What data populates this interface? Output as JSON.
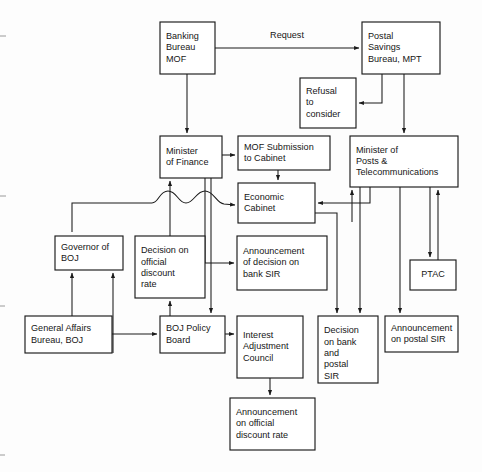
{
  "diagram": {
    "edge_label_request": "Request",
    "colors": {
      "background": "#fdfdfd",
      "box_fill": "#ffffff",
      "line": "#1a1a1a",
      "text": "#161616"
    },
    "nodes": [
      {
        "id": "banking-bureau-mof",
        "lines": [
          "Banking",
          "Bureau",
          "MOF"
        ],
        "x": 160,
        "y": 22,
        "w": 55,
        "h": 52
      },
      {
        "id": "postal-savings-bureau-mpt",
        "lines": [
          "Postal",
          "Savings",
          "Bureau, MPT"
        ],
        "x": 362,
        "y": 22,
        "w": 78,
        "h": 52
      },
      {
        "id": "refusal-to-consider",
        "lines": [
          "Refusal",
          "to",
          "consider"
        ],
        "x": 300,
        "y": 78,
        "w": 56,
        "h": 50
      },
      {
        "id": "minister-of-finance",
        "lines": [
          "Minister",
          "of Finance"
        ],
        "x": 160,
        "y": 136,
        "w": 62,
        "h": 42
      },
      {
        "id": "mof-submission-to-cabinet",
        "lines": [
          "MOF Submission",
          "to Cabinet"
        ],
        "x": 238,
        "y": 136,
        "w": 92,
        "h": 34
      },
      {
        "id": "minister-of-posts",
        "lines": [
          "Minister of",
          "Posts &",
          "Telecommunications"
        ],
        "x": 350,
        "y": 136,
        "w": 108,
        "h": 51
      },
      {
        "id": "economic-cabinet",
        "lines": [
          "Economic",
          "Cabinet"
        ],
        "x": 238,
        "y": 183,
        "w": 77,
        "h": 40
      },
      {
        "id": "governor-of-boj",
        "lines": [
          "Governor of",
          "BOJ"
        ],
        "x": 55,
        "y": 236,
        "w": 68,
        "h": 34
      },
      {
        "id": "decision-on-official-discount-rate",
        "lines": [
          "Decision on",
          "official",
          "discount",
          "rate"
        ],
        "x": 135,
        "y": 236,
        "w": 70,
        "h": 62
      },
      {
        "id": "announcement-bank-sir",
        "lines": [
          "Announcement",
          "of decision on",
          "bank SIR"
        ],
        "x": 237,
        "y": 236,
        "w": 90,
        "h": 54
      },
      {
        "id": "ptac",
        "lines": [
          "PTAC"
        ],
        "x": 410,
        "y": 260,
        "w": 46,
        "h": 30
      },
      {
        "id": "general-affairs-bureau-boj",
        "lines": [
          "General Affairs",
          "Bureau, BOJ"
        ],
        "x": 25,
        "y": 316,
        "w": 87,
        "h": 37
      },
      {
        "id": "boj-policy-board",
        "lines": [
          "BOJ Policy",
          "Board"
        ],
        "x": 160,
        "y": 316,
        "w": 65,
        "h": 37
      },
      {
        "id": "interest-adjustment-council",
        "lines": [
          "Interest",
          "Adjustment",
          "Council"
        ],
        "x": 237,
        "y": 316,
        "w": 66,
        "h": 62
      },
      {
        "id": "decision-bank-postal-sir",
        "lines": [
          "Decision",
          "on bank",
          "and",
          "postal",
          "SIR"
        ],
        "x": 318,
        "y": 316,
        "w": 60,
        "h": 67
      },
      {
        "id": "announcement-postal-sir",
        "lines": [
          "Announcement",
          "on postal SIR"
        ],
        "x": 385,
        "y": 316,
        "w": 73,
        "h": 36
      },
      {
        "id": "announcement-official-discount-rate",
        "lines": [
          "Announcement",
          "on official",
          "discount rate"
        ],
        "x": 230,
        "y": 398,
        "w": 85,
        "h": 52
      }
    ],
    "edges": [
      {
        "id": "banking-to-postal",
        "from": "banking-bureau-mof",
        "to": "postal-savings-bureau-mpt",
        "label": "Request"
      },
      {
        "id": "postal-to-refusal",
        "from": "postal-savings-bureau-mpt",
        "to": "refusal-to-consider",
        "label": ""
      },
      {
        "id": "banking-to-minister-finance",
        "from": "banking-bureau-mof",
        "to": "minister-of-finance",
        "label": ""
      },
      {
        "id": "postal-to-minister-posts",
        "from": "postal-savings-bureau-mpt",
        "to": "minister-of-posts",
        "label": ""
      },
      {
        "id": "minister-finance-to-submission",
        "from": "minister-of-finance",
        "to": "mof-submission-to-cabinet",
        "label": ""
      },
      {
        "id": "submission-to-economic-cabinet",
        "from": "mof-submission-to-cabinet",
        "to": "economic-cabinet",
        "label": ""
      },
      {
        "id": "minister-posts-to-economic-cabinet",
        "from": "minister-of-posts",
        "to": "economic-cabinet",
        "label": ""
      },
      {
        "id": "wavy-to-economic-cabinet",
        "from": "governor-of-boj",
        "to": "economic-cabinet",
        "label": ""
      },
      {
        "id": "minister-finance-to-announcement-bank-sir",
        "from": "minister-of-finance",
        "to": "announcement-bank-sir",
        "label": ""
      },
      {
        "id": "minister-finance-to-boj-policy-board",
        "from": "minister-of-finance",
        "to": "boj-policy-board",
        "label": ""
      },
      {
        "id": "general-affairs-to-governor",
        "from": "general-affairs-bureau-boj",
        "to": "governor-of-boj",
        "label": ""
      },
      {
        "id": "boj-policy-board-to-governor",
        "from": "boj-policy-board",
        "to": "governor-of-boj",
        "label": ""
      },
      {
        "id": "general-affairs-to-boj-policy-board",
        "from": "general-affairs-bureau-boj",
        "to": "boj-policy-board",
        "label": ""
      },
      {
        "id": "boj-policy-board-to-decision-discount",
        "from": "boj-policy-board",
        "to": "decision-on-official-discount-rate",
        "label": ""
      },
      {
        "id": "decision-discount-to-minister-finance",
        "from": "decision-on-official-discount-rate",
        "to": "minister-of-finance",
        "label": ""
      },
      {
        "id": "boj-policy-board-to-interest-council",
        "from": "boj-policy-board",
        "to": "interest-adjustment-council",
        "label": ""
      },
      {
        "id": "interest-council-to-announcement-discount",
        "from": "interest-adjustment-council",
        "to": "announcement-official-discount-rate",
        "label": ""
      },
      {
        "id": "economic-cabinet-to-decision-sir",
        "from": "economic-cabinet",
        "to": "decision-bank-postal-sir",
        "label": ""
      },
      {
        "id": "economic-cabinet-to-minister-posts",
        "from": "economic-cabinet",
        "to": "minister-of-posts",
        "label": ""
      },
      {
        "id": "minister-posts-to-decision-sir",
        "from": "minister-of-posts",
        "to": "decision-bank-postal-sir",
        "label": ""
      },
      {
        "id": "minister-posts-to-announcement-postal-sir",
        "from": "minister-of-posts",
        "to": "announcement-postal-sir",
        "label": ""
      },
      {
        "id": "minister-posts-to-ptac",
        "from": "minister-of-posts",
        "to": "ptac",
        "label": ""
      },
      {
        "id": "ptac-to-minister-posts",
        "from": "ptac",
        "to": "minister-of-posts",
        "label": ""
      }
    ]
  }
}
